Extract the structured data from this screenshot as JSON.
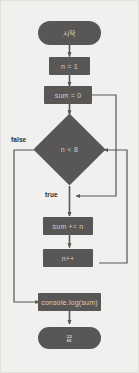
{
  "diagram": {
    "colors": {
      "background": "#f1f0ee",
      "node_fill": "#595755",
      "node_text": "#cfcecb",
      "wire": "#595755",
      "label_text": "#2c2b29"
    },
    "nodes": {
      "start": "시작",
      "init_n": "n = 1",
      "init_sum": "sum = 0",
      "condition": "n < 8",
      "accumulate": "sum += n",
      "increment": "n++",
      "output": "console.log(sum)",
      "end": "끝"
    },
    "edge_labels": {
      "false": "false",
      "true": "true"
    }
  }
}
